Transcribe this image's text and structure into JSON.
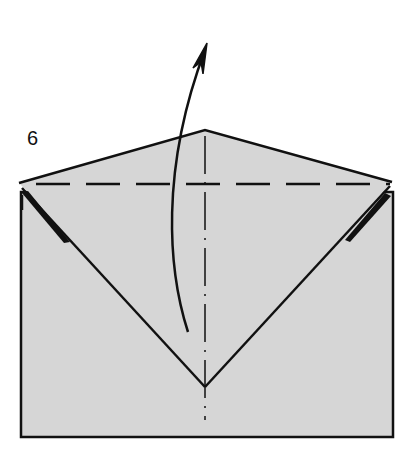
{
  "diagram": {
    "type": "origami-step",
    "step_number": "6",
    "colors": {
      "paper": "#d6d6d6",
      "line": "#111111",
      "background": "#ffffff"
    },
    "elements": [
      {
        "name": "envelope-body",
        "kind": "rectangle"
      },
      {
        "name": "triangular-flap",
        "kind": "folded flap"
      },
      {
        "name": "valley-fold-line",
        "kind": "dashed horizontal line"
      },
      {
        "name": "center-crease",
        "kind": "dash-dot vertical line"
      },
      {
        "name": "fold-arrow",
        "kind": "curved arrow pointing up"
      }
    ]
  }
}
